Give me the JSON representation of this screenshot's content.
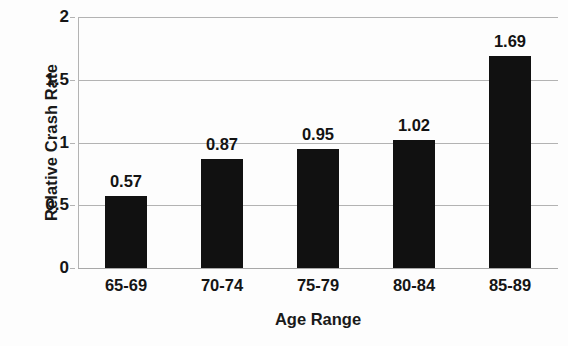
{
  "chart_data": {
    "type": "bar",
    "title": "",
    "xlabel": "Age Range",
    "ylabel": "Relative Crash Rate",
    "categories": [
      "65-69",
      "70-74",
      "75-79",
      "80-84",
      "85-89"
    ],
    "values": [
      0.57,
      0.87,
      0.95,
      1.02,
      1.69
    ],
    "value_labels": [
      "0.57",
      "0.87",
      "0.95",
      "1.02",
      "1.69"
    ],
    "ylim": [
      0,
      2
    ],
    "ytick_values": [
      0,
      0.5,
      1,
      1.5,
      2
    ],
    "ytick_labels": [
      "0",
      "0.5",
      "1",
      "1.5",
      "2"
    ],
    "grid": true,
    "grid_axis": "y",
    "legend": false,
    "bar_color": "#111111",
    "grid_color": "#b3b3b3",
    "background_color": "#fdfdfd",
    "series": [
      {
        "name": "Relative Crash Rate",
        "values": [
          0.57,
          0.87,
          0.95,
          1.02,
          1.69
        ]
      }
    ]
  }
}
